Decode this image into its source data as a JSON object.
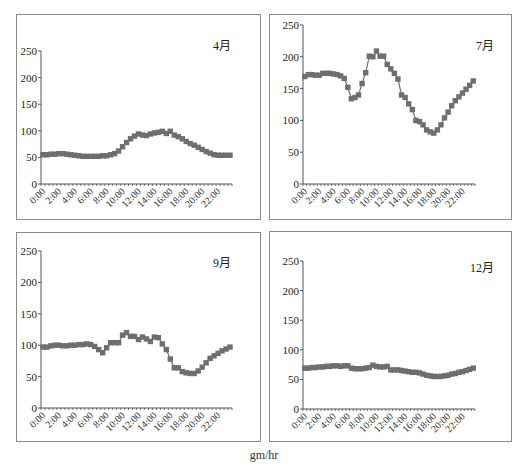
{
  "unit_label": "gm/hr",
  "series_color": "#6e6e6e",
  "chart_data": [
    {
      "type": "line",
      "title": "4月",
      "xlabel": "",
      "ylabel": "",
      "ylim": [
        0,
        250
      ],
      "yticks": [
        0,
        50,
        100,
        150,
        200,
        250
      ],
      "xticks": [
        "0:00",
        "2:00",
        "4:00",
        "6:00",
        "8:00",
        "10:00",
        "12:00",
        "14:00",
        "16:00",
        "18:00",
        "20:00",
        "22:00"
      ],
      "interval": "30min",
      "grid": false,
      "values": [
        55,
        55,
        56,
        56,
        57,
        57,
        56,
        55,
        54,
        53,
        52,
        52,
        52,
        52,
        52,
        53,
        53,
        55,
        57,
        62,
        70,
        78,
        85,
        90,
        94,
        92,
        91,
        94,
        96,
        97,
        99,
        95,
        99,
        92,
        89,
        85,
        80,
        76,
        73,
        69,
        65,
        61,
        58,
        55,
        54,
        54,
        54,
        54
      ]
    },
    {
      "type": "line",
      "title": "7月",
      "xlabel": "",
      "ylabel": "",
      "ylim": [
        0,
        250
      ],
      "yticks": [
        0,
        50,
        100,
        150,
        200,
        250
      ],
      "xticks": [
        "0:00",
        "2:00",
        "4:00",
        "6:00",
        "8:00",
        "10:00",
        "12:00",
        "14:00",
        "16:00",
        "18:00",
        "20:00",
        "22:00"
      ],
      "interval": "30min",
      "grid": false,
      "values": [
        169,
        172,
        172,
        171,
        171,
        174,
        174,
        174,
        173,
        172,
        170,
        166,
        152,
        134,
        136,
        140,
        158,
        175,
        201,
        200,
        209,
        201,
        201,
        188,
        181,
        174,
        165,
        140,
        136,
        126,
        117,
        100,
        98,
        93,
        85,
        82,
        80,
        85,
        93,
        104,
        113,
        123,
        131,
        137,
        143,
        149,
        155,
        162
      ]
    },
    {
      "type": "line",
      "title": "9月",
      "xlabel": "",
      "ylabel": "",
      "ylim": [
        0,
        250
      ],
      "yticks": [
        0,
        50,
        100,
        150,
        200,
        250
      ],
      "xticks": [
        "0:00",
        "2:00",
        "4:00",
        "6:00",
        "8:00",
        "10:00",
        "12:00",
        "14:00",
        "16:00",
        "18:00",
        "20:00",
        "22:00"
      ],
      "interval": "30min",
      "grid": false,
      "values": [
        97,
        97,
        99,
        100,
        100,
        99,
        99,
        100,
        100,
        101,
        101,
        102,
        101,
        98,
        93,
        88,
        96,
        104,
        104,
        104,
        116,
        120,
        114,
        114,
        109,
        113,
        110,
        106,
        113,
        112,
        102,
        93,
        78,
        64,
        64,
        58,
        56,
        55,
        55,
        59,
        65,
        72,
        79,
        83,
        87,
        91,
        94,
        97,
        100,
        102
      ]
    },
    {
      "type": "line",
      "title": "12月",
      "xlabel": "",
      "ylabel": "",
      "ylim": [
        0,
        250
      ],
      "yticks": [
        0,
        50,
        100,
        150,
        200,
        250
      ],
      "xticks": [
        "0:00",
        "2:00",
        "4:00",
        "6:00",
        "8:00",
        "10:00",
        "12:00",
        "14:00",
        "16:00",
        "18:00",
        "20:00",
        "22:00"
      ],
      "interval": "30min",
      "grid": false,
      "values": [
        69,
        69,
        70,
        70,
        71,
        71,
        72,
        72,
        73,
        73,
        72,
        73,
        73,
        69,
        68,
        68,
        68,
        69,
        70,
        74,
        72,
        71,
        71,
        72,
        66,
        66,
        66,
        65,
        64,
        63,
        62,
        62,
        61,
        59,
        57,
        56,
        55,
        55,
        55,
        56,
        57,
        59,
        60,
        62,
        63,
        65,
        67,
        69
      ]
    }
  ]
}
